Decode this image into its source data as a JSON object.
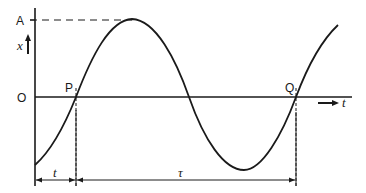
{
  "diagram": {
    "type": "sinusoidal-oscillation",
    "labels": {
      "amplitude": "A",
      "origin": "O",
      "y_axis": "x",
      "x_axis": "t",
      "point_p": "P",
      "point_q": "Q",
      "interval_t": "t",
      "interval_tau": "τ"
    },
    "colors": {
      "line": "#1a1a1a",
      "background": "#ffffff"
    }
  }
}
